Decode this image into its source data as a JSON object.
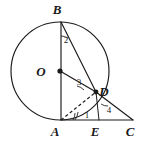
{
  "figure": {
    "canvas": {
      "width": 150,
      "height": 145,
      "background": "#ffffff"
    },
    "stroke_color": "#1a1a1a"
  },
  "points": {
    "B": {
      "label": "B",
      "x": 61,
      "y": 22,
      "label_x": 57,
      "label_y": 14
    },
    "O": {
      "label": "O",
      "x": 60,
      "y": 71,
      "label_x": 41,
      "label_y": 76
    },
    "A": {
      "label": "A",
      "x": 61,
      "y": 120,
      "label_x": 55,
      "label_y": 136
    },
    "D": {
      "label": "D",
      "x": 96,
      "y": 92,
      "label_x": 102,
      "label_y": 94
    },
    "E": {
      "label": "E",
      "x": 99,
      "y": 120,
      "label_x": 94,
      "label_y": 136
    },
    "C": {
      "label": "C",
      "x": 133,
      "y": 120,
      "label_x": 128,
      "label_y": 136
    }
  },
  "circle": {
    "center_x": 60,
    "center_y": 71,
    "radius": 49
  },
  "angles": [
    {
      "id": "angle-2",
      "label": "2",
      "x": 66,
      "y": 40
    },
    {
      "id": "angle-3",
      "label": "3",
      "x": 79,
      "y": 82
    },
    {
      "id": "angle-1",
      "label": "1",
      "x": 87,
      "y": 117
    },
    {
      "id": "angle-4",
      "label": "4",
      "x": 108,
      "y": 111
    }
  ],
  "segments": [
    {
      "id": "segment-BA",
      "from": "B",
      "to": "A",
      "style": "solid"
    },
    {
      "id": "segment-BD",
      "from": "B",
      "to": "D",
      "style": "solid"
    },
    {
      "id": "segment-OD",
      "from": "O",
      "to": "D",
      "style": "solid"
    },
    {
      "id": "segment-DC",
      "from": "D",
      "to": "C",
      "style": "solid"
    },
    {
      "id": "segment-AC",
      "from": "A",
      "to": "C",
      "style": "solid"
    },
    {
      "id": "segment-DE",
      "from": "D",
      "to": "E",
      "style": "solid"
    },
    {
      "id": "segment-AD",
      "from": "A",
      "to": "D",
      "style": "dashed"
    }
  ]
}
